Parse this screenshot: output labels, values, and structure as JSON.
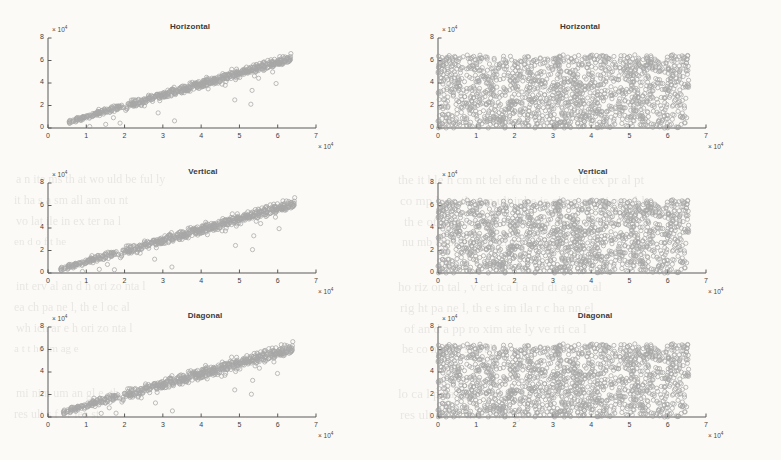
{
  "figure": {
    "background": "#fbfaf7",
    "marker_color": "#9a9a9a",
    "axis_color": "#5a5a5a",
    "text_color": "#3a3a3a"
  },
  "axis": {
    "y_ticks": [
      "0",
      "2",
      "4",
      "6",
      "8"
    ],
    "y_values": [
      0,
      2,
      4,
      6,
      8
    ],
    "x_ticks": [
      "0",
      "1",
      "2",
      "3",
      "4",
      "5",
      "6",
      "7"
    ],
    "x_values": [
      0,
      1,
      2,
      3,
      4,
      5,
      6,
      7
    ],
    "exponent_label": "× 10",
    "exponent_power": "4",
    "xlim": [
      0,
      7
    ],
    "ylim": [
      0,
      8
    ]
  },
  "bleed_text": [
    {
      "t": "the it ble h cm nt tel efu nd e th e eld ex pr al pt",
      "x": 398,
      "y": 172,
      "s": 13
    },
    {
      "t": "co mp le x, th e m ult ipl e is ob se rv ati on al ly",
      "x": 400,
      "y": 193,
      "s": 13
    },
    {
      "t": "th e ot he r h an d, th e ch an ne l o f t he",
      "x": 404,
      "y": 214,
      "s": 13
    },
    {
      "t": "nu mb er of th e ex ter na l f iel ds",
      "x": 402,
      "y": 235,
      "s": 12
    },
    {
      "t": "ho riz on tal , v ert ica l a nd di ag on al",
      "x": 398,
      "y": 279,
      "s": 13
    },
    {
      "t": "rig ht pa ne l, th e s im ila r c ha nn el",
      "x": 400,
      "y": 300,
      "s": 13
    },
    {
      "t": "of an d a pp ro xim ate ly ve rti ca l",
      "x": 404,
      "y": 321,
      "s": 13
    },
    {
      "t": "be co me s a s m all er va lu e a s",
      "x": 402,
      "y": 342,
      "s": 12
    },
    {
      "t": "lo ca l p ea k, th e r igh t p an el",
      "x": 398,
      "y": 386,
      "s": 13
    },
    {
      "t": "res ult s f or th e i ma ge",
      "x": 400,
      "y": 407,
      "s": 13
    },
    {
      "t": "a n ite ms th at wo uld be ful ly",
      "x": 16,
      "y": 172,
      "s": 12
    },
    {
      "t": "it ha s a sm all am ou nt",
      "x": 14,
      "y": 193,
      "s": 12
    },
    {
      "t": "vo lat ile in ex ter na l",
      "x": 16,
      "y": 214,
      "s": 12
    },
    {
      "t": "en d o f t he",
      "x": 14,
      "y": 235,
      "s": 11
    },
    {
      "t": "int erv al an d h ori zo nta l",
      "x": 16,
      "y": 279,
      "s": 12
    },
    {
      "t": "ea ch pa ne l, th e l oc al",
      "x": 14,
      "y": 300,
      "s": 12
    },
    {
      "t": "wh ich ar e h ori zo nta l",
      "x": 16,
      "y": 321,
      "s": 12
    },
    {
      "t": "a t t he im ag e",
      "x": 14,
      "y": 342,
      "s": 11
    },
    {
      "t": "mi nim um an gl e, th en",
      "x": 16,
      "y": 386,
      "s": 12
    },
    {
      "t": "res ult s f or lea st",
      "x": 14,
      "y": 407,
      "s": 12
    }
  ],
  "chart_data": [
    {
      "id": "left-horizontal",
      "type": "scatter",
      "title": "Horizontal",
      "column": "left",
      "xlabel": "× 10⁴",
      "ylabel": "× 10⁴",
      "xlim": [
        0,
        7
      ],
      "ylim": [
        0,
        8
      ],
      "xtick_labels": [
        "0",
        "1",
        "2",
        "3",
        "4",
        "5",
        "6",
        "7"
      ],
      "ytick_labels": [
        "0",
        "2",
        "4",
        "6",
        "8"
      ],
      "grid": false,
      "legend": null,
      "marker": "open-circle",
      "marker_color": "#9a9a9a",
      "n_points": 700,
      "distribution": "correlated-linear",
      "description": "Strongly correlated cloud along y = x, spanning x from 0.55e4 to 6.3e4 and y from 0.5e4 to 6.2e4, with mild vertical scatter and a handful of outliers below the trend.",
      "fit": {
        "slope": 0.97,
        "intercept": 0.02,
        "noise_sigma": 0.22
      },
      "x_range_data": [
        0.55,
        6.35
      ],
      "y_range_data": [
        0.45,
        6.25
      ]
    },
    {
      "id": "left-vertical",
      "type": "scatter",
      "title": "Vertical",
      "column": "left",
      "xlabel": "× 10⁴",
      "ylabel": "× 10⁴",
      "xlim": [
        0,
        7
      ],
      "ylim": [
        0,
        8
      ],
      "xtick_labels": [
        "0",
        "1",
        "2",
        "3",
        "4",
        "5",
        "6",
        "7"
      ],
      "ytick_labels": [
        "0",
        "2",
        "4",
        "6",
        "8"
      ],
      "grid": false,
      "legend": null,
      "marker": "open-circle",
      "marker_color": "#9a9a9a",
      "n_points": 700,
      "distribution": "correlated-linear",
      "description": "Strongly correlated cloud along y = x, spanning x from 0.35e4 to 6.4e4, slightly wider scatter than Horizontal panel.",
      "fit": {
        "slope": 0.95,
        "intercept": 0.05,
        "noise_sigma": 0.26
      },
      "x_range_data": [
        0.33,
        6.45
      ],
      "y_range_data": [
        0.4,
        6.2
      ]
    },
    {
      "id": "left-diagonal",
      "type": "scatter",
      "title": "Diagonal",
      "column": "left",
      "xlabel": "× 10⁴",
      "ylabel": "× 10⁴",
      "xlim": [
        0,
        7
      ],
      "ylim": [
        0,
        8
      ],
      "xtick_labels": [
        "0",
        "1",
        "2",
        "3",
        "4",
        "5",
        "6",
        "7"
      ],
      "ytick_labels": [
        "0",
        "2",
        "4",
        "6",
        "8"
      ],
      "grid": false,
      "legend": null,
      "marker": "open-circle",
      "marker_color": "#9a9a9a",
      "n_points": 700,
      "distribution": "correlated-linear",
      "description": "Strongly correlated cloud along y = x with a dense knot near 5.8e4-6.3e4 and more dispersion in the mid range.",
      "fit": {
        "slope": 0.94,
        "intercept": 0.08,
        "noise_sigma": 0.3
      },
      "x_range_data": [
        0.4,
        6.4
      ],
      "y_range_data": [
        0.35,
        6.25
      ]
    },
    {
      "id": "right-horizontal",
      "type": "scatter",
      "title": "Horizontal",
      "column": "right",
      "xlabel": "× 10⁴",
      "ylabel": "× 10⁴",
      "xlim": [
        0,
        7
      ],
      "ylim": [
        0,
        8
      ],
      "xtick_labels": [
        "0",
        "1",
        "2",
        "3",
        "4",
        "5",
        "6",
        "7"
      ],
      "ytick_labels": [
        "0",
        "2",
        "4",
        "6",
        "8"
      ],
      "grid": false,
      "legend": null,
      "marker": "open-circle",
      "marker_color": "#9a9a9a",
      "n_points": 1600,
      "distribution": "uniform-random",
      "description": "Uniform random scatter completely filling the rectangle x in [0, 6.55e4], y in [0, 6.5e4]; no correlation.",
      "x_range_data": [
        0.0,
        6.55
      ],
      "y_range_data": [
        0.0,
        6.5
      ]
    },
    {
      "id": "right-vertical",
      "type": "scatter",
      "title": "Vertical",
      "column": "right",
      "xlabel": "× 10⁴",
      "ylabel": "× 10⁴",
      "xlim": [
        0,
        7
      ],
      "ylim": [
        0,
        8
      ],
      "xtick_labels": [
        "0",
        "1",
        "2",
        "3",
        "4",
        "5",
        "6",
        "7"
      ],
      "ytick_labels": [
        "0",
        "2",
        "4",
        "6",
        "8"
      ],
      "grid": false,
      "legend": null,
      "marker": "open-circle",
      "marker_color": "#9a9a9a",
      "n_points": 1600,
      "distribution": "uniform-random",
      "description": "Uniform random scatter filling x in [0, 6.55e4], y in [0, 6.5e4]; no correlation.",
      "x_range_data": [
        0.0,
        6.55
      ],
      "y_range_data": [
        0.0,
        6.5
      ]
    },
    {
      "id": "right-diagonal",
      "type": "scatter",
      "title": "Diagonal",
      "column": "right",
      "xlabel": "× 10⁴",
      "ylabel": "× 10⁴",
      "xlim": [
        0,
        7
      ],
      "ylim": [
        0,
        8
      ],
      "xtick_labels": [
        "0",
        "1",
        "2",
        "3",
        "4",
        "5",
        "6",
        "7"
      ],
      "ytick_labels": [
        "0",
        "2",
        "4",
        "6",
        "8"
      ],
      "grid": false,
      "legend": null,
      "marker": "open-circle",
      "marker_color": "#9a9a9a",
      "n_points": 1600,
      "distribution": "uniform-random",
      "description": "Uniform random scatter filling x in [0, 6.55e4], y in [0, 6.5e4]; no correlation.",
      "x_range_data": [
        0.0,
        6.55
      ],
      "y_range_data": [
        0.0,
        6.5
      ]
    }
  ]
}
